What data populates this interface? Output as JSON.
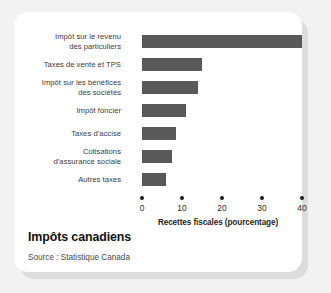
{
  "card": {
    "title": "Impôts canadiens",
    "source": "Source : Statistique Canada"
  },
  "chart_data": {
    "type": "bar",
    "orientation": "horizontal",
    "title": "Impôts canadiens",
    "xlabel": "Recettes fiscales (pourcentage)",
    "ylabel": "",
    "xlim": [
      0,
      40
    ],
    "xticks": [
      0,
      10,
      20,
      30,
      40
    ],
    "xticklabels": [
      "0",
      "10",
      "20",
      "30",
      "40"
    ],
    "grid": false,
    "legend": false,
    "bar_color": "#595959",
    "categories": [
      "Impôt sur le revenu des particuliers",
      "Taxes de vente et TPS",
      "Impôt sur les bénéfices des sociétés",
      "Impôt foncier",
      "Taxes d'accise",
      "Cotisations d'assurance sociale",
      "Autres taxes"
    ],
    "category_lines": [
      [
        "Impôt sur le revenu",
        "des particuliers"
      ],
      [
        "Taxes de vente et TPS"
      ],
      [
        "Impôt sur les bénéfices",
        "des sociétés"
      ],
      [
        "Impôt foncier"
      ],
      [
        "Taxes d'accise"
      ],
      [
        "Cotisations",
        "d'assurance sociale"
      ],
      [
        "Autres taxes"
      ]
    ],
    "values": [
      40,
      15,
      14,
      11,
      8.5,
      7.5,
      6
    ]
  }
}
